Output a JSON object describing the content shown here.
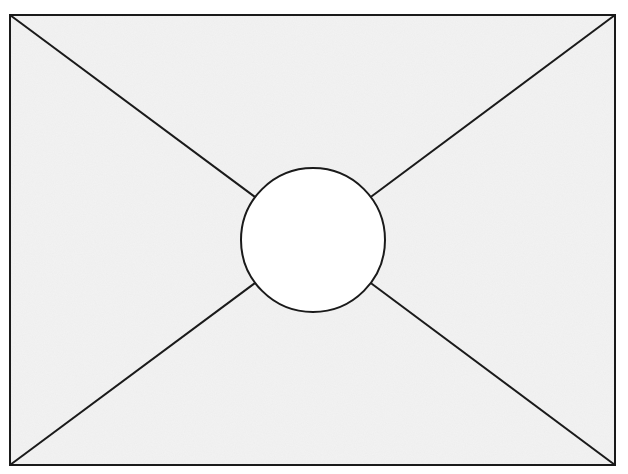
{
  "diagram": {
    "type": "rectangle-with-diagonals-and-center-circle",
    "rectangle": {
      "x1": 10,
      "y1": 15,
      "x2": 615,
      "y2": 465,
      "fill": "#f3f3f3",
      "stroke": "#1a1a1a"
    },
    "circle": {
      "cx": 313,
      "cy": 240,
      "r": 72,
      "fill": "#ffffff",
      "stroke": "#1a1a1a"
    },
    "diagonals": [
      {
        "name": "top-left-diagonal",
        "from": [
          10,
          15
        ],
        "to": "circle"
      },
      {
        "name": "top-right-diagonal",
        "from": [
          615,
          15
        ],
        "to": "circle"
      },
      {
        "name": "bottom-left-diagonal",
        "from": [
          10,
          465
        ],
        "to": "circle"
      },
      {
        "name": "bottom-right-diagonal",
        "from": [
          615,
          465
        ],
        "to": "circle"
      }
    ],
    "labels": []
  }
}
